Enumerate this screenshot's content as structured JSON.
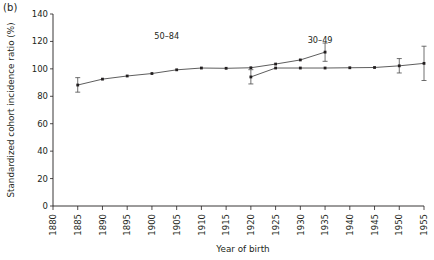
{
  "figure": {
    "panel_label": "(b)",
    "background_color": "#ffffff",
    "ink_color": "#231f20"
  },
  "chart_data": {
    "type": "line",
    "title": "",
    "subtitle": "",
    "xlabel": "Year of birth",
    "ylabel": "Standardized cohort incidence ratio (%)",
    "xlim": [
      1880,
      1955
    ],
    "ylim": [
      0,
      140
    ],
    "xticks": [
      1880,
      1885,
      1890,
      1895,
      1900,
      1905,
      1910,
      1915,
      1920,
      1925,
      1930,
      1935,
      1940,
      1945,
      1950,
      1955
    ],
    "xtick_labels": [
      "1880",
      "1885",
      "1890",
      "1895",
      "1900",
      "1905",
      "1910",
      "1915",
      "1920",
      "1925",
      "1930",
      "1935",
      "1940",
      "1945",
      "1950",
      "1955"
    ],
    "xtick_rotation": 90,
    "yticks": [
      0,
      20,
      40,
      60,
      80,
      100,
      120,
      140
    ],
    "ytick_labels": [
      "0",
      "20",
      "40",
      "60",
      "80",
      "100",
      "120",
      "140"
    ],
    "grid": false,
    "legend": "inline-annotations",
    "error_bars": "vertical 95% CI",
    "series": [
      {
        "name": "50-84",
        "label": "50–84",
        "label_x": 1903,
        "label_y": 122,
        "color": "#4b4b4b",
        "x": [
          1885,
          1890,
          1895,
          1900,
          1905,
          1910,
          1915,
          1920,
          1925,
          1930,
          1935
        ],
        "values": [
          88.2,
          92.5,
          94.8,
          96.6,
          99.3,
          100.6,
          100.4,
          100.8,
          103.5,
          106.5,
          112.2
        ],
        "err_low": [
          83.0,
          null,
          null,
          null,
          null,
          null,
          null,
          null,
          null,
          null,
          105.5
        ],
        "err_high": [
          93.6,
          null,
          null,
          null,
          null,
          null,
          null,
          null,
          null,
          null,
          118.8
        ]
      },
      {
        "name": "30-49",
        "label": "30–49",
        "label_x": 1934,
        "label_y": 119,
        "color": "#4b4b4b",
        "x": [
          1920,
          1925,
          1930,
          1935,
          1940,
          1945,
          1950,
          1955
        ],
        "values": [
          94.1,
          100.6,
          100.6,
          100.6,
          100.8,
          101.0,
          102.2,
          104.0
        ],
        "err_low": [
          89.0,
          null,
          null,
          null,
          null,
          null,
          97.0,
          91.5
        ],
        "err_high": [
          99.4,
          null,
          null,
          null,
          null,
          null,
          107.5,
          116.5
        ]
      }
    ]
  }
}
